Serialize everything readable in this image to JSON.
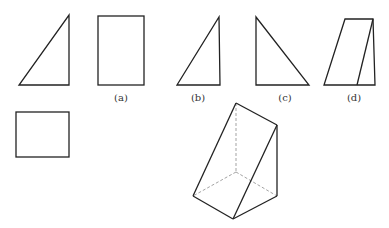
{
  "figure": {
    "labels": {
      "a": "(a)",
      "b": "(b)",
      "c": "(c)",
      "d": "(d)"
    },
    "colors": {
      "stroke": "#222222",
      "hidden": "#999999",
      "background": "#ffffff"
    },
    "views": [
      {
        "name": "front-view-triangle",
        "points": [
          [
            19,
            85
          ],
          [
            69,
            85
          ],
          [
            69,
            15
          ]
        ]
      },
      {
        "name": "side-view-rectangle",
        "rect": {
          "x": 98,
          "y": 16,
          "w": 46,
          "h": 69
        },
        "label": "(a)"
      },
      {
        "name": "option-b-triangle",
        "points": [
          [
            177,
            85
          ],
          [
            220,
            85
          ],
          [
            219,
            17
          ]
        ],
        "label": "(b)"
      },
      {
        "name": "option-c-triangle",
        "points": [
          [
            256,
            17
          ],
          [
            256,
            85
          ],
          [
            309,
            85
          ]
        ],
        "label": "(c)"
      },
      {
        "name": "option-d-trapezoid",
        "points": [
          [
            345,
            19
          ],
          [
            373,
            19
          ],
          [
            375,
            85
          ],
          [
            324,
            85
          ]
        ],
        "inner_line": [
          [
            373,
            19
          ],
          [
            357,
            85
          ]
        ],
        "label": "(d)"
      },
      {
        "name": "top-view-rectangle",
        "rect": {
          "x": 16,
          "y": 112,
          "w": 53,
          "h": 45
        }
      },
      {
        "name": "prism-3d",
        "vertices": {
          "top": [
            236,
            103
          ],
          "right_top": [
            277,
            125
          ],
          "bottom_left": [
            193,
            196
          ],
          "bottom": [
            233,
            219
          ],
          "bottom_right": [
            277,
            196
          ],
          "hidden": [
            236,
            172
          ]
        }
      }
    ]
  }
}
